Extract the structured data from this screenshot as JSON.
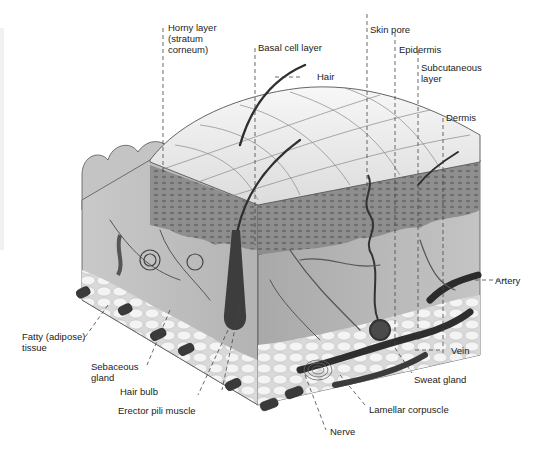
{
  "diagram": {
    "labels": {
      "horny_layer": "Horny layer\n(stratum\ncorneum)",
      "basal_cell_layer": "Basal cell layer",
      "hair": "Hair",
      "skin_pore": "Skin pore",
      "epidermis": "Epidermis",
      "subcutaneous_layer": "Subcutaneous\nlayer",
      "dermis": "Dermis",
      "artery": "Artery",
      "vein": "Vein",
      "sweat_gland": "Sweat gland",
      "lamellar_corpuscle": "Lamellar corpuscle",
      "nerve": "Nerve",
      "erector_pili_muscle": "Erector pili muscle",
      "hair_bulb": "Hair bulb",
      "sebaceous_gland": "Sebaceous\ngland",
      "fatty_tissue": "Fatty (adipose)\ntissue"
    },
    "colors": {
      "surface": "#ececec",
      "epidermis": "#8a8a8a",
      "dermis": "#bdbdbd",
      "fat": "#e6e6e6",
      "vessel": "#3a3a3a",
      "leader": "#444444",
      "text": "#222222"
    }
  }
}
